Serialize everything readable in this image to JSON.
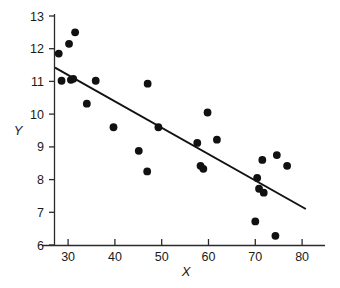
{
  "chart_data": {
    "type": "scatter",
    "title": "",
    "xlabel": "X",
    "ylabel": "Y",
    "xlim": [
      25,
      85
    ],
    "ylim": [
      6,
      13
    ],
    "xticks": [
      30,
      40,
      50,
      60,
      70,
      80
    ],
    "yticks": [
      6,
      7,
      8,
      9,
      10,
      11,
      12,
      13
    ],
    "xtick_labels": [
      "30",
      "40",
      "50",
      "60",
      "70",
      "80"
    ],
    "ytick_labels": [
      "6",
      "7",
      "8",
      "9",
      "10",
      "11",
      "12",
      "13"
    ],
    "grid": false,
    "legend": null,
    "marker": "filled-circle",
    "marker_color": "#111111",
    "points": [
      {
        "x": 28.0,
        "y": 11.85
      },
      {
        "x": 28.6,
        "y": 11.02
      },
      {
        "x": 30.2,
        "y": 12.15
      },
      {
        "x": 30.6,
        "y": 11.05
      },
      {
        "x": 31.1,
        "y": 11.08
      },
      {
        "x": 31.5,
        "y": 12.5
      },
      {
        "x": 34.0,
        "y": 10.32
      },
      {
        "x": 35.9,
        "y": 11.02
      },
      {
        "x": 39.7,
        "y": 9.6
      },
      {
        "x": 45.1,
        "y": 8.88
      },
      {
        "x": 46.9,
        "y": 8.25
      },
      {
        "x": 47.0,
        "y": 10.93
      },
      {
        "x": 49.3,
        "y": 9.6
      },
      {
        "x": 57.6,
        "y": 9.12
      },
      {
        "x": 58.3,
        "y": 8.42
      },
      {
        "x": 58.9,
        "y": 8.33
      },
      {
        "x": 59.8,
        "y": 10.05
      },
      {
        "x": 61.8,
        "y": 9.22
      },
      {
        "x": 70.0,
        "y": 6.72
      },
      {
        "x": 70.4,
        "y": 8.05
      },
      {
        "x": 70.8,
        "y": 7.72
      },
      {
        "x": 71.5,
        "y": 8.6
      },
      {
        "x": 71.8,
        "y": 7.6
      },
      {
        "x": 74.3,
        "y": 6.28
      },
      {
        "x": 74.6,
        "y": 8.75
      },
      {
        "x": 76.8,
        "y": 8.42
      }
    ],
    "fit_line": {
      "type": "linear-regression",
      "x_start": 27.2,
      "y_start": 11.42,
      "x_end": 80.8,
      "y_end": 7.1
    }
  },
  "figure": {
    "background_color": "#ffffff",
    "axis_color": "#2b2b2b",
    "data_color": "#111111"
  }
}
